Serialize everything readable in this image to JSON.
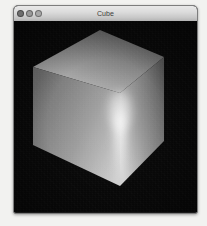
{
  "window": {
    "title": "Cube",
    "controls": [
      {
        "name": "close-button",
        "label": "Close",
        "color": "#6e6e6e"
      },
      {
        "name": "minimize-button",
        "label": "Minimize",
        "color": "#9a9a9a"
      },
      {
        "name": "zoom-button",
        "label": "Zoom",
        "color": "#a8a8a8"
      }
    ],
    "chrome_color": "#d6d6d6",
    "border_color": "#7d7d7d"
  },
  "viewport": {
    "name": "opengl-render-view",
    "background_color": "#080808",
    "scene": "Shaded 3D cube",
    "object": {
      "name": "cube",
      "shading": "smooth-gouraud",
      "highlight": "specular streak along front vertical edge",
      "faces": [
        {
          "name": "top-face",
          "points": "19,46 86,9 150,36 106,72",
          "gradient_from": "#b9b9b9",
          "gradient_to": "#6d6d6d"
        },
        {
          "name": "left-face",
          "points": "19,46 106,72 106,165 19,124",
          "gradient_from": "#8e8e8e",
          "gradient_to": "#4a4a4a"
        },
        {
          "name": "right-face",
          "points": "106,72 150,36 150,120 106,165",
          "gradient_from": "#c8c8c8",
          "gradient_to": "#555555"
        }
      ]
    }
  },
  "page": {
    "background_color": "#f2f2f0"
  }
}
